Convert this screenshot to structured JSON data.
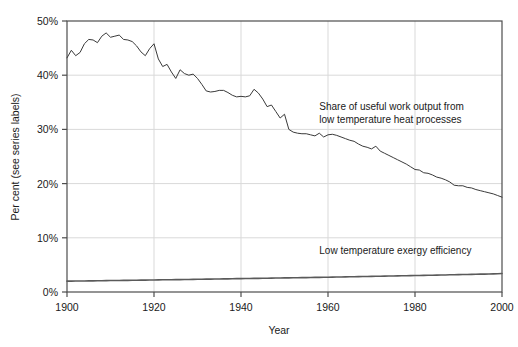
{
  "figure": {
    "clipped_header": "",
    "background_color": "#ffffff",
    "frame_color": "#4d4d4d",
    "grid_color": "#d9d9d9",
    "line_color": "#3a3a3a"
  },
  "chart_data": {
    "type": "line",
    "title": "",
    "xlabel": "Year",
    "ylabel": "Per cent (see series labels)",
    "xlim": [
      1900,
      2000
    ],
    "ylim": [
      0,
      50
    ],
    "xticks": [
      1900,
      1920,
      1940,
      1960,
      1980,
      2000
    ],
    "xtick_labels": [
      "1900",
      "1920",
      "1940",
      "1960",
      "1980",
      "2000"
    ],
    "yticks": [
      0,
      10,
      20,
      30,
      40,
      50
    ],
    "ytick_labels": [
      "0%",
      "10%",
      "20%",
      "30%",
      "40%",
      "50%"
    ],
    "grid": true,
    "legend": "annotations",
    "annotations": [
      {
        "name": "share-label",
        "lines": [
          "Share of useful work output from",
          "low temperature heat processes"
        ],
        "x": 1958,
        "y": 33.5
      },
      {
        "name": "efficiency-label",
        "lines": [
          "Low temperature exergy efficiency"
        ],
        "x": 1958,
        "y": 7.0
      }
    ],
    "x": [
      1900,
      1901,
      1902,
      1903,
      1904,
      1905,
      1906,
      1907,
      1908,
      1909,
      1910,
      1911,
      1912,
      1913,
      1914,
      1915,
      1916,
      1917,
      1918,
      1919,
      1920,
      1921,
      1922,
      1923,
      1924,
      1925,
      1926,
      1927,
      1928,
      1929,
      1930,
      1931,
      1932,
      1933,
      1934,
      1935,
      1936,
      1937,
      1938,
      1939,
      1940,
      1941,
      1942,
      1943,
      1944,
      1945,
      1946,
      1947,
      1948,
      1949,
      1950,
      1951,
      1952,
      1953,
      1954,
      1955,
      1956,
      1957,
      1958,
      1959,
      1960,
      1961,
      1962,
      1963,
      1964,
      1965,
      1966,
      1967,
      1968,
      1969,
      1970,
      1971,
      1972,
      1973,
      1974,
      1975,
      1976,
      1977,
      1978,
      1979,
      1980,
      1981,
      1982,
      1983,
      1984,
      1985,
      1986,
      1987,
      1988,
      1989,
      1990,
      1991,
      1992,
      1993,
      1994,
      1995,
      1996,
      1997,
      1998,
      1999,
      2000
    ],
    "series": [
      {
        "name": "Share of useful work output from low temperature heat processes",
        "values": [
          43.2,
          44.6,
          43.6,
          44.2,
          45.8,
          46.6,
          46.5,
          46.0,
          47.2,
          47.8,
          47.0,
          47.2,
          47.4,
          46.6,
          46.5,
          46.2,
          45.4,
          44.3,
          43.6,
          44.9,
          45.8,
          43.0,
          41.6,
          42.0,
          40.6,
          39.4,
          41.0,
          40.3,
          40.0,
          40.2,
          39.4,
          38.3,
          37.1,
          36.9,
          37.0,
          37.2,
          37.2,
          36.8,
          36.3,
          36.0,
          36.1,
          36.0,
          36.2,
          37.4,
          36.7,
          35.6,
          34.2,
          34.5,
          33.3,
          32.1,
          32.8,
          30.0,
          29.5,
          29.3,
          29.2,
          29.2,
          29.0,
          28.8,
          29.3,
          28.6,
          29.0,
          29.1,
          28.9,
          28.6,
          28.3,
          28.0,
          27.8,
          27.3,
          26.9,
          26.7,
          26.4,
          26.9,
          26.0,
          25.6,
          25.2,
          24.8,
          24.4,
          24.0,
          23.6,
          23.1,
          22.6,
          22.5,
          22.0,
          21.9,
          21.6,
          21.2,
          21.0,
          20.7,
          20.3,
          19.7,
          19.6,
          19.6,
          19.3,
          19.2,
          18.9,
          18.7,
          18.5,
          18.3,
          18.1,
          17.8,
          17.5
        ],
        "color": "#3a3a3a",
        "line_width": 1.0
      },
      {
        "name": "Low temperature exergy efficiency",
        "values": [
          2.0,
          2.01,
          2.02,
          2.03,
          2.04,
          2.05,
          2.06,
          2.07,
          2.08,
          2.09,
          2.11,
          2.12,
          2.13,
          2.14,
          2.15,
          2.16,
          2.17,
          2.19,
          2.2,
          2.21,
          2.22,
          2.23,
          2.25,
          2.26,
          2.27,
          2.28,
          2.29,
          2.31,
          2.32,
          2.33,
          2.34,
          2.36,
          2.37,
          2.38,
          2.39,
          2.41,
          2.42,
          2.43,
          2.44,
          2.46,
          2.47,
          2.48,
          2.49,
          2.51,
          2.52,
          2.53,
          2.54,
          2.56,
          2.57,
          2.58,
          2.6,
          2.61,
          2.62,
          2.64,
          2.65,
          2.66,
          2.68,
          2.69,
          2.7,
          2.72,
          2.73,
          2.75,
          2.76,
          2.78,
          2.79,
          2.81,
          2.82,
          2.84,
          2.85,
          2.87,
          2.88,
          2.9,
          2.91,
          2.93,
          2.94,
          2.96,
          2.97,
          2.99,
          3.0,
          3.02,
          3.04,
          3.05,
          3.07,
          3.08,
          3.1,
          3.12,
          3.13,
          3.15,
          3.17,
          3.18,
          3.2,
          3.22,
          3.23,
          3.25,
          3.27,
          3.29,
          3.3,
          3.32,
          3.34,
          3.36,
          3.4
        ],
        "color": "#5a5a5a",
        "line_width": 1.6
      }
    ]
  }
}
